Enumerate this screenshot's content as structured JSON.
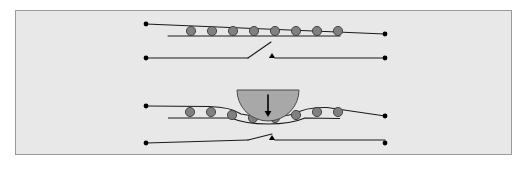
{
  "figure": {
    "panel": {
      "background_color": "#e8e8e8",
      "border_color": "#9a9a9a",
      "x": 15,
      "y": 10,
      "width": 497,
      "height": 145
    },
    "canvas": {
      "width": 524,
      "height": 169,
      "background_color": "#ffffff"
    }
  },
  "style": {
    "line_color": "#1a1a1a",
    "bead_fill": "#808080",
    "bead_stroke": "#3a3a3a",
    "indenter_fill": "#a8a8a8",
    "indenter_stroke": "#4a4a4a",
    "terminal_fill": "#000000",
    "arrow_color": "#000000",
    "line_width": 1.1,
    "bead_radius": 4.6
  },
  "scenes": [
    {
      "id": "undeformed",
      "label": "undeformed state",
      "chain": {
        "label": "bead chain on straight wire",
        "left_terminal": {
          "x": 146,
          "y": 24
        },
        "right_terminal": {
          "x": 385,
          "y": 34
        },
        "rail_top": {
          "x1": 146,
          "y1": 24,
          "x2": 385,
          "y2": 34
        },
        "rail_bottom": {
          "x1": 168,
          "y1": 36,
          "x2": 340,
          "y2": 36
        },
        "bead_count": 8,
        "bead_centers": [
          {
            "x": 191,
            "y": 31
          },
          {
            "x": 212,
            "y": 31
          },
          {
            "x": 233,
            "y": 31
          },
          {
            "x": 254,
            "y": 31
          },
          {
            "x": 275,
            "y": 31
          },
          {
            "x": 296,
            "y": 31
          },
          {
            "x": 317,
            "y": 31
          },
          {
            "x": 338,
            "y": 31
          }
        ]
      },
      "switch": {
        "label": "open switch",
        "state": "open",
        "left_terminal": {
          "x": 146,
          "y": 58
        },
        "right_terminal": {
          "x": 385,
          "y": 58
        },
        "wire_left": {
          "x1": 146,
          "y1": 58,
          "x2": 248,
          "y2": 58
        },
        "wire_right": {
          "x1": 275,
          "y1": 58,
          "x2": 385,
          "y2": 58
        },
        "blade": {
          "x1": 248,
          "y1": 58,
          "x2": 271,
          "y2": 42
        },
        "contact_marker": {
          "x": 272,
          "y": 57
        }
      }
    },
    {
      "id": "indented",
      "label": "indented state",
      "chain": {
        "label": "bead chain deformed by indenter",
        "left_terminal": {
          "x": 146,
          "y": 106
        },
        "right_terminal": {
          "x": 385,
          "y": 116
        },
        "bead_count": 8,
        "bead_centers": [
          {
            "x": 190,
            "y": 112
          },
          {
            "x": 211,
            "y": 112
          },
          {
            "x": 232,
            "y": 115
          },
          {
            "x": 253,
            "y": 118
          },
          {
            "x": 275,
            "y": 118
          },
          {
            "x": 296,
            "y": 115
          },
          {
            "x": 317,
            "y": 112
          },
          {
            "x": 338,
            "y": 112
          }
        ]
      },
      "indenter": {
        "label": "semicircular indenter",
        "shape": "half-disc",
        "center": {
          "x": 268,
          "y": 90
        },
        "radius": 31,
        "flat_top_y": 90,
        "bottom_y": 119,
        "arrow": {
          "label": "applied load direction",
          "direction": "down",
          "x": 268,
          "y_start": 95,
          "y_end": 117
        }
      },
      "switch": {
        "label": "closed switch",
        "state": "closed",
        "left_terminal": {
          "x": 146,
          "y": 143
        },
        "right_terminal": {
          "x": 385,
          "y": 143
        },
        "wire_left": {
          "x1": 146,
          "y1": 143,
          "x2": 248,
          "y2": 140
        },
        "wire_right": {
          "x1": 275,
          "y1": 140,
          "x2": 385,
          "y2": 140
        },
        "blade": {
          "x1": 248,
          "y1": 140,
          "x2": 272,
          "y2": 134
        },
        "contact_marker": {
          "x": 272,
          "y": 139
        }
      }
    }
  ]
}
